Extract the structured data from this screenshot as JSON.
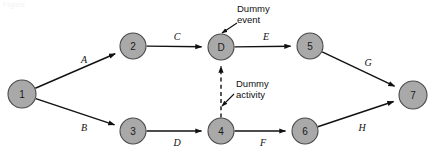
{
  "diagram": {
    "watermark": "Figure",
    "colors": {
      "node_fill": "#a9a9a9",
      "node_stroke": "#4a4a4a",
      "edge": "#111111",
      "background": "#ffffff",
      "text": "#111111"
    },
    "nodes": [
      {
        "id": "n1",
        "label": "1",
        "cx": 22,
        "cy": 94,
        "r": 14
      },
      {
        "id": "n2",
        "label": "2",
        "cx": 133,
        "cy": 46,
        "r": 13
      },
      {
        "id": "n3",
        "label": "3",
        "cx": 133,
        "cy": 131,
        "r": 13
      },
      {
        "id": "nD",
        "label": "D",
        "cx": 221,
        "cy": 47,
        "r": 13
      },
      {
        "id": "n4",
        "label": "4",
        "cx": 221,
        "cy": 131,
        "r": 13
      },
      {
        "id": "n5",
        "label": "5",
        "cx": 310,
        "cy": 46,
        "r": 13
      },
      {
        "id": "n6",
        "label": "6",
        "cx": 305,
        "cy": 131,
        "r": 13
      },
      {
        "id": "n7",
        "label": "7",
        "cx": 413,
        "cy": 95,
        "r": 14
      }
    ],
    "edges": [
      {
        "id": "eA",
        "label": "A",
        "from": "n1",
        "to": "n2",
        "style": "solid",
        "label_x": 84,
        "label_y": 59
      },
      {
        "id": "eB",
        "label": "B",
        "from": "n1",
        "to": "n3",
        "style": "solid",
        "label_x": 84,
        "label_y": 127
      },
      {
        "id": "eC",
        "label": "C",
        "from": "n2",
        "to": "nD",
        "style": "solid",
        "label_x": 177,
        "label_y": 36
      },
      {
        "id": "eD",
        "label": "D",
        "from": "n3",
        "to": "n4",
        "style": "solid",
        "label_x": 177,
        "label_y": 142
      },
      {
        "id": "eE",
        "label": "E",
        "from": "nD",
        "to": "n5",
        "style": "solid",
        "label_x": 266,
        "label_y": 36
      },
      {
        "id": "eF",
        "label": "F",
        "from": "n4",
        "to": "n6",
        "style": "solid",
        "label_x": 263,
        "label_y": 142
      },
      {
        "id": "eG",
        "label": "G",
        "from": "n5",
        "to": "n7",
        "style": "solid",
        "label_x": 368,
        "label_y": 62
      },
      {
        "id": "eH",
        "label": "H",
        "from": "n6",
        "to": "n7",
        "style": "solid",
        "label_x": 362,
        "label_y": 127
      },
      {
        "id": "eDummy",
        "label": "",
        "from": "n4",
        "to": "nD",
        "style": "dashed",
        "label_x": 0,
        "label_y": 0
      }
    ],
    "callouts": [
      {
        "id": "callout-dummy-event",
        "text": "Dummy\nevent",
        "text_x": 237,
        "text_y": 3,
        "leader_x1": 237,
        "leader_y1": 23,
        "leader_x2": 222,
        "leader_y2": 33
      },
      {
        "id": "callout-dummy-activity",
        "text": "Dummy\nactivity",
        "text_x": 236,
        "text_y": 78,
        "leader_x1": 234,
        "leader_y1": 94,
        "leader_x2": 222,
        "leader_y2": 106
      }
    ]
  }
}
